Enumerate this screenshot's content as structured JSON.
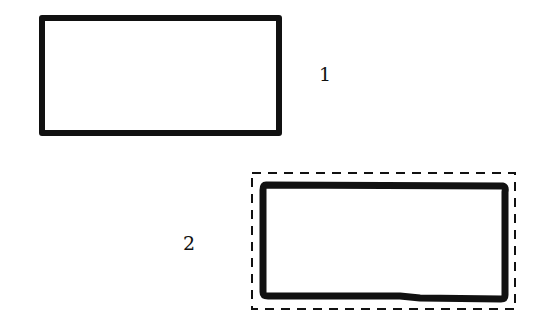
{
  "diagram": {
    "background": "#ffffff",
    "stroke_color": "#111111",
    "shapes": [
      {
        "id": "rect-1",
        "label": "1",
        "style": "solid-bold",
        "selected": false
      },
      {
        "id": "rect-2",
        "label": "2",
        "style": "solid-bold",
        "selected": true,
        "selection_outline": "dashed"
      }
    ]
  }
}
